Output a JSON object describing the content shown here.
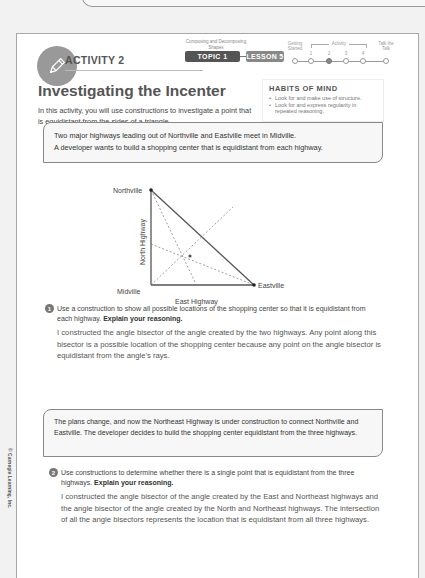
{
  "header": {
    "activity_label": "ACTIVITY 2",
    "topic_caption": "Composing and Decomposing Shapes",
    "topic_pill": "TOPIC 1",
    "lesson_pill": "LESSON 5",
    "progress": {
      "steps": [
        {
          "label": "Getting Started",
          "active": false
        },
        {
          "label": "1",
          "active": false
        },
        {
          "label": "2",
          "active": true
        },
        {
          "label": "3",
          "active": false
        },
        {
          "label": "4",
          "active": false
        },
        {
          "label": "Talk the Talk",
          "active": false
        }
      ],
      "group_label": "Activity"
    }
  },
  "title": "Investigating the Incenter",
  "intro": "In this activity, you will use constructions to investigate a point that is equidistant from the sides of a triangle.",
  "habits": {
    "title": "HABITS OF MIND",
    "items": [
      "Look for and make use of structure.",
      "Look for and express regularity in repeated reasoning."
    ]
  },
  "scenario1": {
    "line1": "Two major highways leading out of Northville and Eastville meet in Midville.",
    "line2": "A developer wants to build a shopping center that is equidistant from each highway."
  },
  "diagram": {
    "labels": {
      "northville": "Northville",
      "eastville": "Eastville",
      "midville": "Midville",
      "north_highway": "North Highway",
      "east_highway": "East Highway"
    }
  },
  "question1": {
    "number": "1",
    "prompt": "Use a construction to show all possible locations of the shopping center so that it is equidistant from each highway.",
    "emphasis": "Explain your reasoning.",
    "answer": "I constructed the angle bisector of the angle created by the two highways. Any point along this bisector is a possible location of the shopping center because any point on the angle bisector is equidistant from the angle's rays."
  },
  "scenario2": {
    "text": "The plans change, and now the Northeast Highway is under construction to connect Northville and Eastville. The developer decides to build the shopping center equidistant from the three highways."
  },
  "question2": {
    "number": "2",
    "prompt": "Use constructions to determine whether there is a single point that is equidistant from the three highways.",
    "emphasis": "Explain your reasoning.",
    "answer": "I constructed the angle bisector of the angle created by the East and Northeast highways and the angle bisector of the angle created by the North and Northeast highways. The intersection of all the angle bisectors represents the location that is equidistant from all three highways."
  },
  "copyright": "© Carnegie Learning, Inc."
}
